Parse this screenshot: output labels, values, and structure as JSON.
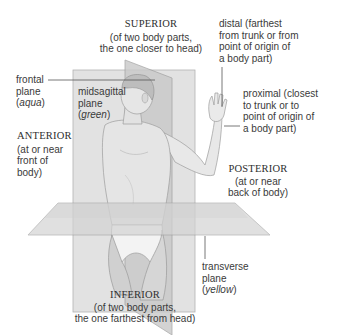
{
  "diagram": {
    "colors": {
      "plane_fill": "#d9d9d9",
      "plane_fill_dark": "#c4c4c4",
      "plane_edge": "#9a9a9a",
      "skin": "#e6e6e6",
      "skin_shadow": "#b8b8b8",
      "leader_line": "#555555",
      "text": "#3a3a3a"
    },
    "labels": {
      "superior": {
        "heading": "SUPERIOR",
        "line1": "(of two body parts,",
        "line2": "the one closer to head)"
      },
      "inferior": {
        "heading": "INFERIOR",
        "line1": "(of two body parts,",
        "line2": "the one farthest from head)"
      },
      "anterior": {
        "heading": "ANTERIOR",
        "line1": "(at or near",
        "line2": "front of",
        "line3": "body)"
      },
      "posterior": {
        "heading": "POSTERIOR",
        "line1": "(at or near",
        "line2": "back of body)"
      },
      "distal": {
        "line1": "distal (farthest",
        "line2": "from trunk or from",
        "line3": "point of origin of",
        "line4": "a body part)"
      },
      "proximal": {
        "line1": "proximal (closest",
        "line2": "to trunk or to",
        "line3": "point of origin of",
        "line4": "a body part)"
      },
      "frontal_plane": {
        "line1": "frontal",
        "line2": "plane",
        "color_open": "(",
        "color": "aqua",
        "color_close": ")"
      },
      "midsagittal_plane": {
        "line1": "midsagittal",
        "line2": "plane",
        "color_open": "(",
        "color": "green",
        "color_close": ")"
      },
      "transverse_plane": {
        "line1": "transverse",
        "line2": "plane",
        "color_open": "(",
        "color": "yellow",
        "color_close": ")"
      }
    }
  }
}
